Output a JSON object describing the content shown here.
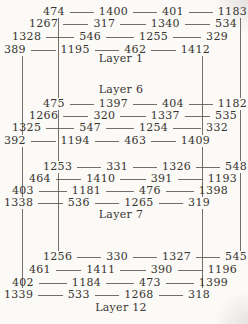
{
  "figure": {
    "colors": {
      "ink": "#38342f",
      "line": "#5a564f",
      "paper": "#fbfaf7"
    },
    "layers": [
      {
        "label": "Layer 1",
        "rows": [
          [
            "474",
            "1400",
            "401",
            "1183"
          ],
          [
            "1267",
            "317",
            "1340",
            "534"
          ],
          [
            "1328",
            "546",
            "1255",
            "329"
          ],
          [
            "389",
            "1195",
            "462",
            "1412"
          ]
        ]
      },
      {
        "label": "Layer 6",
        "rows": [
          [
            "475",
            "1397",
            "404",
            "1182"
          ],
          [
            "1266",
            "320",
            "1337",
            "535"
          ],
          [
            "1325",
            "547",
            "1254",
            "332"
          ],
          [
            "392",
            "1194",
            "463",
            "1409"
          ]
        ]
      },
      {
        "label": "Layer 7",
        "rows": [
          [
            "1253",
            "331",
            "1326",
            "548"
          ],
          [
            "464",
            "1410",
            "391",
            "1193"
          ],
          [
            "403",
            "1181",
            "476",
            "1398"
          ],
          [
            "1338",
            "536",
            "1265",
            "319"
          ]
        ]
      },
      {
        "label": "Layer 12",
        "rows": [
          [
            "1256",
            "330",
            "1327",
            "545"
          ],
          [
            "461",
            "1411",
            "390",
            "1196"
          ],
          [
            "402",
            "1184",
            "473",
            "1399"
          ],
          [
            "1339",
            "533",
            "1268",
            "318"
          ]
        ]
      }
    ]
  }
}
